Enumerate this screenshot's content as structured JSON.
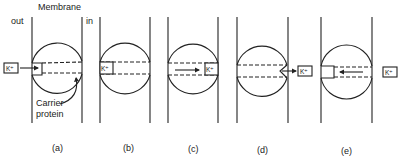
{
  "figure": {
    "header": {
      "membrane_label": "Membrane",
      "out_label": "out",
      "in_label": "in"
    },
    "ion_label": "K⁺",
    "carrier_label_line1": "Carrier",
    "carrier_label_line2": "protein",
    "panels": [
      {
        "id": "a",
        "caption": "(a)",
        "description": "K+ approaches carrier channel open to outside"
      },
      {
        "id": "b",
        "caption": "(b)",
        "description": "K+ bound at outer end of carrier"
      },
      {
        "id": "c",
        "caption": "(c)",
        "description": "K+ translocated to inner end"
      },
      {
        "id": "d",
        "caption": "(d)",
        "description": "K+ released to inside"
      },
      {
        "id": "e",
        "caption": "(e)",
        "description": "Carrier reorients, empty channel returns"
      }
    ],
    "colors": {
      "ink": "#222222",
      "background": "#ffffff"
    }
  }
}
